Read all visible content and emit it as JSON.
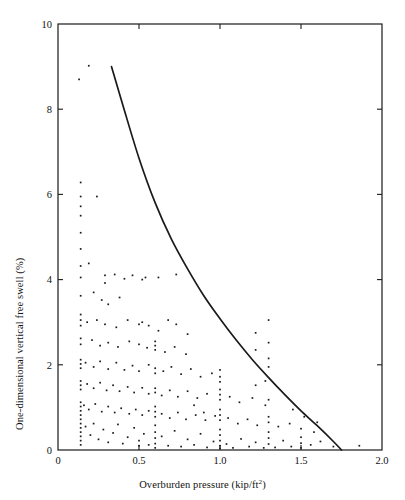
{
  "chart_data": {
    "type": "scatter",
    "title": "",
    "subtitle": "",
    "xlabel": "Overburden pressure (kip/ft",
    "xlabel_sup": "2",
    "xlabel_suffix": ")",
    "xlabel_full": "Overburden pressure (kip/ft2)",
    "ylabel": "One-dimensional vertical free swell (%)",
    "xlim": [
      0,
      2.0
    ],
    "ylim": [
      0,
      10
    ],
    "xticks": [
      0,
      0.5,
      1.0,
      1.5,
      2.0
    ],
    "xtick_labels": [
      "0",
      "0.5",
      "1.0",
      "1.5",
      "2.0"
    ],
    "yticks": [
      0,
      2,
      4,
      6,
      8,
      10
    ],
    "ytick_labels": [
      "0",
      "2",
      "4",
      "6",
      "8",
      "10"
    ],
    "grid": false,
    "legend": "none",
    "frame": "box-all-four-sides-inward-ticks",
    "marker_color": "#1a1a1a",
    "curve_color": "#1a1a1a",
    "background": "#ffffff",
    "series": [
      {
        "name": "upper bound curve",
        "type": "line",
        "comment": "decaying envelope curve bounding the data cloud",
        "x": [
          0.33,
          0.4,
          0.5,
          0.6,
          0.7,
          0.8,
          0.9,
          1.0,
          1.1,
          1.2,
          1.3,
          1.4,
          1.5,
          1.6,
          1.7,
          1.75
        ],
        "y": [
          9.0,
          8.1,
          6.85,
          5.8,
          4.95,
          4.25,
          3.62,
          3.08,
          2.58,
          2.12,
          1.7,
          1.3,
          0.92,
          0.57,
          0.2,
          0.0
        ]
      },
      {
        "name": "free swell measurements",
        "type": "scatter",
        "points": [
          [
            0.13,
            8.7
          ],
          [
            0.19,
            9.02
          ],
          [
            0.14,
            6.28
          ],
          [
            0.14,
            5.95
          ],
          [
            0.14,
            5.72
          ],
          [
            0.14,
            5.5
          ],
          [
            0.14,
            5.1
          ],
          [
            0.14,
            4.72
          ],
          [
            0.24,
            5.95
          ],
          [
            0.14,
            4.32
          ],
          [
            0.14,
            4.05
          ],
          [
            0.19,
            4.38
          ],
          [
            0.29,
            4.1
          ],
          [
            0.29,
            3.92
          ],
          [
            0.35,
            4.12
          ],
          [
            0.41,
            4.02
          ],
          [
            0.46,
            4.1
          ],
          [
            0.52,
            4.0
          ],
          [
            0.54,
            4.05
          ],
          [
            0.62,
            4.05
          ],
          [
            0.73,
            4.12
          ],
          [
            0.14,
            3.62
          ],
          [
            0.22,
            3.7
          ],
          [
            0.27,
            3.52
          ],
          [
            0.31,
            3.42
          ],
          [
            0.38,
            3.58
          ],
          [
            0.14,
            3.18
          ],
          [
            0.14,
            3.05
          ],
          [
            0.14,
            2.92
          ],
          [
            0.18,
            3.0
          ],
          [
            0.24,
            3.05
          ],
          [
            0.29,
            2.95
          ],
          [
            0.36,
            2.88
          ],
          [
            0.43,
            3.05
          ],
          [
            0.5,
            2.95
          ],
          [
            0.52,
            3.0
          ],
          [
            0.56,
            2.92
          ],
          [
            0.62,
            2.8
          ],
          [
            0.68,
            3.05
          ],
          [
            0.73,
            2.95
          ],
          [
            0.8,
            2.72
          ],
          [
            0.14,
            2.62
          ],
          [
            0.14,
            2.48
          ],
          [
            0.21,
            2.58
          ],
          [
            0.26,
            2.45
          ],
          [
            0.31,
            2.52
          ],
          [
            0.37,
            2.42
          ],
          [
            0.44,
            2.55
          ],
          [
            0.5,
            2.48
          ],
          [
            0.55,
            2.4
          ],
          [
            0.6,
            2.55
          ],
          [
            0.6,
            2.45
          ],
          [
            0.6,
            2.35
          ],
          [
            0.66,
            2.3
          ],
          [
            0.72,
            2.42
          ],
          [
            0.79,
            2.25
          ],
          [
            0.14,
            2.12
          ],
          [
            0.14,
            2.02
          ],
          [
            0.14,
            1.92
          ],
          [
            0.17,
            2.05
          ],
          [
            0.22,
            1.95
          ],
          [
            0.26,
            2.08
          ],
          [
            0.31,
            1.9
          ],
          [
            0.36,
            2.05
          ],
          [
            0.41,
            1.88
          ],
          [
            0.46,
            1.98
          ],
          [
            0.5,
            1.85
          ],
          [
            0.56,
            2.0
          ],
          [
            0.6,
            1.92
          ],
          [
            0.6,
            1.8
          ],
          [
            0.65,
            1.85
          ],
          [
            0.7,
            1.95
          ],
          [
            0.76,
            1.78
          ],
          [
            0.82,
            1.9
          ],
          [
            0.88,
            1.72
          ],
          [
            0.95,
            1.8
          ],
          [
            1.0,
            1.88
          ],
          [
            1.0,
            1.72
          ],
          [
            1.0,
            1.6
          ],
          [
            0.14,
            1.62
          ],
          [
            0.14,
            1.52
          ],
          [
            0.14,
            1.42
          ],
          [
            0.18,
            1.55
          ],
          [
            0.22,
            1.45
          ],
          [
            0.26,
            1.58
          ],
          [
            0.3,
            1.4
          ],
          [
            0.34,
            1.52
          ],
          [
            0.38,
            1.38
          ],
          [
            0.43,
            1.48
          ],
          [
            0.47,
            1.35
          ],
          [
            0.52,
            1.46
          ],
          [
            0.56,
            1.32
          ],
          [
            0.6,
            1.45
          ],
          [
            0.6,
            1.35
          ],
          [
            0.64,
            1.28
          ],
          [
            0.69,
            1.4
          ],
          [
            0.74,
            1.25
          ],
          [
            0.8,
            1.38
          ],
          [
            0.86,
            1.22
          ],
          [
            0.92,
            1.32
          ],
          [
            1.0,
            1.42
          ],
          [
            1.0,
            1.3
          ],
          [
            1.0,
            1.18
          ],
          [
            1.06,
            1.25
          ],
          [
            1.12,
            1.12
          ],
          [
            1.2,
            1.22
          ],
          [
            1.28,
            1.05
          ],
          [
            1.3,
            1.18
          ],
          [
            0.14,
            1.12
          ],
          [
            0.14,
            1.02
          ],
          [
            0.14,
            0.92
          ],
          [
            0.16,
            1.05
          ],
          [
            0.19,
            0.95
          ],
          [
            0.23,
            1.08
          ],
          [
            0.27,
            0.9
          ],
          [
            0.31,
            1.02
          ],
          [
            0.35,
            0.88
          ],
          [
            0.39,
            0.98
          ],
          [
            0.44,
            0.85
          ],
          [
            0.48,
            0.95
          ],
          [
            0.52,
            0.82
          ],
          [
            0.56,
            0.92
          ],
          [
            0.6,
            1.02
          ],
          [
            0.6,
            0.9
          ],
          [
            0.6,
            0.78
          ],
          [
            0.64,
            0.85
          ],
          [
            0.69,
            0.75
          ],
          [
            0.74,
            0.88
          ],
          [
            0.79,
            0.72
          ],
          [
            0.85,
            0.82
          ],
          [
            0.91,
            0.7
          ],
          [
            0.97,
            0.8
          ],
          [
            1.0,
            0.95
          ],
          [
            1.0,
            0.82
          ],
          [
            1.0,
            0.7
          ],
          [
            1.05,
            0.75
          ],
          [
            1.11,
            0.62
          ],
          [
            1.17,
            0.72
          ],
          [
            1.23,
            0.58
          ],
          [
            1.3,
            0.78
          ],
          [
            1.3,
            0.65
          ],
          [
            1.36,
            0.55
          ],
          [
            1.43,
            0.62
          ],
          [
            1.5,
            0.5
          ],
          [
            1.58,
            0.42
          ],
          [
            0.14,
            0.82
          ],
          [
            0.14,
            0.72
          ],
          [
            0.14,
            0.62
          ],
          [
            0.14,
            0.52
          ],
          [
            0.14,
            0.42
          ],
          [
            0.14,
            0.32
          ],
          [
            0.14,
            0.22
          ],
          [
            0.14,
            0.12
          ],
          [
            0.17,
            0.55
          ],
          [
            0.2,
            0.35
          ],
          [
            0.22,
            0.62
          ],
          [
            0.25,
            0.25
          ],
          [
            0.28,
            0.48
          ],
          [
            0.31,
            0.18
          ],
          [
            0.34,
            0.4
          ],
          [
            0.37,
            0.6
          ],
          [
            0.4,
            0.15
          ],
          [
            0.43,
            0.3
          ],
          [
            0.47,
            0.52
          ],
          [
            0.5,
            0.1
          ],
          [
            0.5,
            0.22
          ],
          [
            0.53,
            0.38
          ],
          [
            0.56,
            0.12
          ],
          [
            0.6,
            0.58
          ],
          [
            0.6,
            0.42
          ],
          [
            0.6,
            0.28
          ],
          [
            0.6,
            0.15
          ],
          [
            0.6,
            0.05
          ],
          [
            0.64,
            0.32
          ],
          [
            0.68,
            0.1
          ],
          [
            0.72,
            0.45
          ],
          [
            0.76,
            0.08
          ],
          [
            0.8,
            0.25
          ],
          [
            0.84,
            0.12
          ],
          [
            0.88,
            0.38
          ],
          [
            0.92,
            0.06
          ],
          [
            0.96,
            0.2
          ],
          [
            1.0,
            0.48
          ],
          [
            1.0,
            0.35
          ],
          [
            1.0,
            0.22
          ],
          [
            1.0,
            0.1
          ],
          [
            1.0,
            0.04
          ],
          [
            1.04,
            0.14
          ],
          [
            1.08,
            0.05
          ],
          [
            1.13,
            0.26
          ],
          [
            1.18,
            0.08
          ],
          [
            1.22,
            0.18
          ],
          [
            1.27,
            0.05
          ],
          [
            1.3,
            0.42
          ],
          [
            1.3,
            0.28
          ],
          [
            1.3,
            0.14
          ],
          [
            1.34,
            0.06
          ],
          [
            1.39,
            0.22
          ],
          [
            1.44,
            0.08
          ],
          [
            1.5,
            0.3
          ],
          [
            1.5,
            0.16
          ],
          [
            1.5,
            0.05
          ],
          [
            1.56,
            0.12
          ],
          [
            1.62,
            0.2
          ],
          [
            1.7,
            0.08
          ],
          [
            1.86,
            0.1
          ],
          [
            0.9,
            0.88
          ],
          [
            0.84,
            1.05
          ],
          [
            1.22,
            1.52
          ],
          [
            1.28,
            1.62
          ],
          [
            1.3,
            1.95
          ],
          [
            1.3,
            2.15
          ],
          [
            1.22,
            2.35
          ],
          [
            1.3,
            2.52
          ],
          [
            1.22,
            2.75
          ],
          [
            1.3,
            3.05
          ],
          [
            1.45,
            0.95
          ],
          [
            1.52,
            0.78
          ],
          [
            1.6,
            0.65
          ]
        ]
      }
    ]
  },
  "axes": {
    "plot_left_px": 58,
    "plot_right_px": 382,
    "plot_top_px": 24,
    "plot_bottom_px": 450
  }
}
